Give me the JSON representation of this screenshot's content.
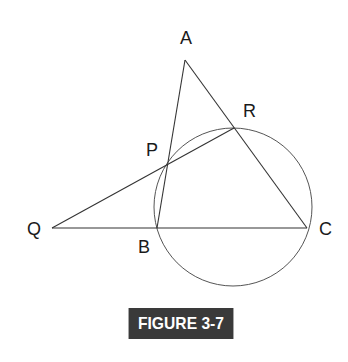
{
  "figure": {
    "caption": "FIGURE 3-7",
    "caption_bg": "#3a3a3a",
    "caption_fg": "#ffffff"
  },
  "points": {
    "A": {
      "label": "A",
      "x": 185,
      "y": 60
    },
    "R": {
      "label": "R",
      "x": 234,
      "y": 128
    },
    "P": {
      "label": "P",
      "x": 168,
      "y": 164
    },
    "Q": {
      "label": "Q",
      "x": 52,
      "y": 228
    },
    "B": {
      "label": "B",
      "x": 157,
      "y": 228
    },
    "C": {
      "label": "C",
      "x": 307,
      "y": 228
    }
  },
  "segments": [
    "A-B",
    "A-C",
    "Q-C",
    "Q-R"
  ],
  "circle": {
    "cx": 233,
    "cy": 207,
    "r": 79,
    "through": [
      "P",
      "R",
      "B",
      "C"
    ]
  }
}
